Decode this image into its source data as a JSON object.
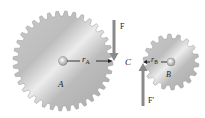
{
  "diagram": {
    "gear_a": {
      "label": "A",
      "radius_label": "r",
      "radius_sub": "A",
      "center": [
        63,
        61
      ],
      "outer_radius": 50,
      "teeth": 36
    },
    "gear_b": {
      "label": "B",
      "radius_label": "r",
      "radius_sub": "B",
      "center": [
        171,
        62
      ],
      "outer_radius": 28,
      "teeth": 18
    },
    "contact_point": {
      "label": "C"
    },
    "force_on_a": {
      "label": "F",
      "direction": "down"
    },
    "force_on_b": {
      "label": "F'",
      "direction": "up"
    },
    "colors": {
      "gear_light": "#e6e6e6",
      "gear_dark": "#a9a9a9",
      "arrow": "#8a8a8a",
      "text": "#222222"
    }
  }
}
